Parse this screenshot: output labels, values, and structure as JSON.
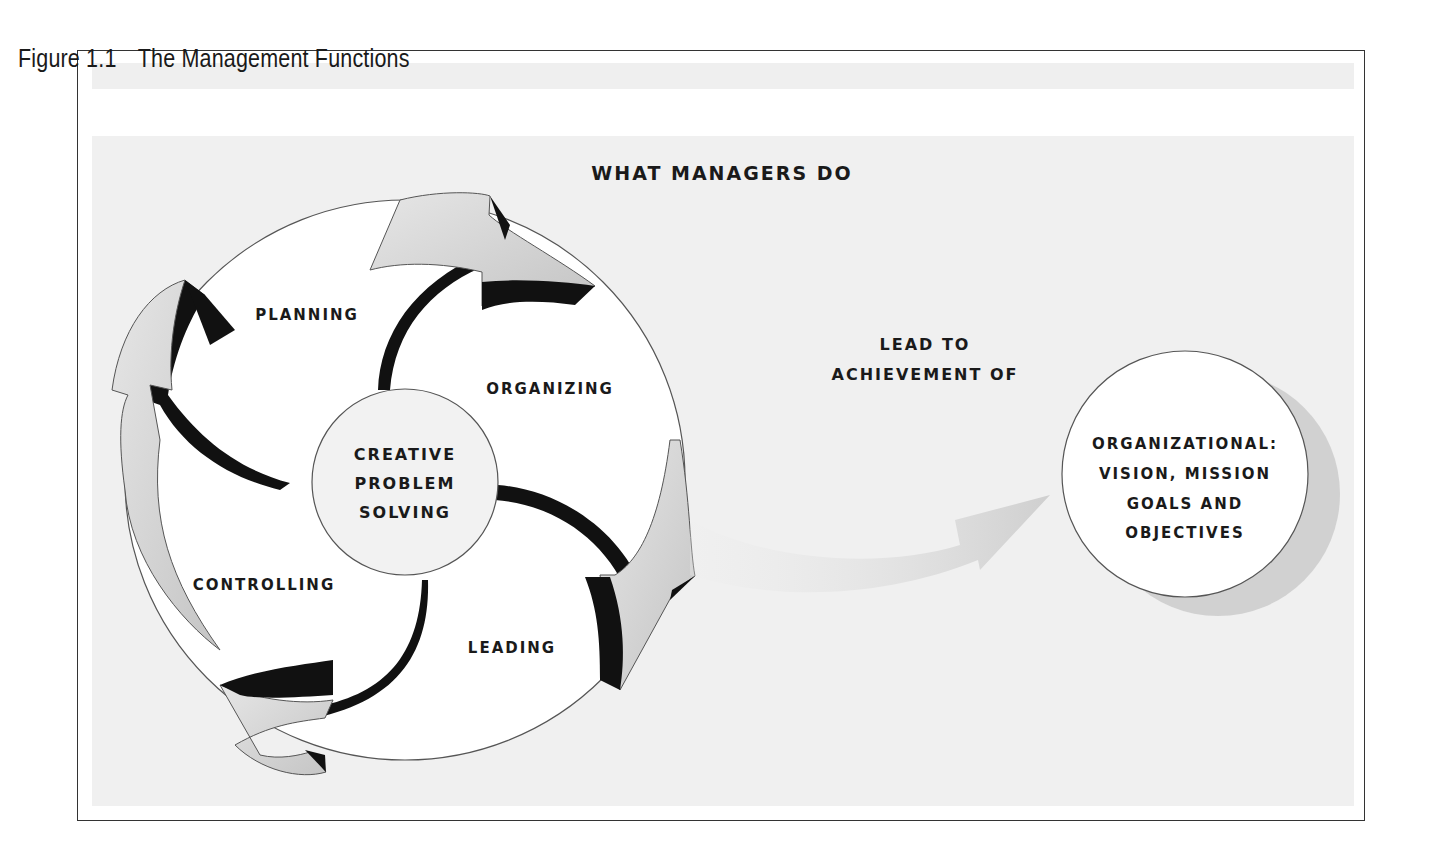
{
  "figure": {
    "number_label": "Figure 1.1",
    "title": "The Management Functions"
  },
  "diagram": {
    "heading": "What Managers Do",
    "center": {
      "line1": "Creative",
      "line2": "Problem",
      "line3": "Solving"
    },
    "functions": [
      {
        "label": "Planning"
      },
      {
        "label": "Organizing"
      },
      {
        "label": "Leading"
      },
      {
        "label": "Controlling"
      }
    ],
    "connector": {
      "line1": "Lead to",
      "line2": "Achievement of"
    },
    "outcome": {
      "line1": "Organizational:",
      "line2": "vision, mission",
      "line3": "goals and",
      "line4": "objectives"
    },
    "colors": {
      "arrow_fill": "#d0d0d0",
      "arrow_shadow": "#111111",
      "background": "#f0f0f0",
      "circle_fill": "#ffffff",
      "text": "#1a1a1a"
    }
  }
}
